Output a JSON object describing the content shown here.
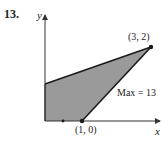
{
  "problem_number": "13.",
  "axes": {
    "x_label": "x",
    "y_label": "y"
  },
  "vertices": [
    {
      "label": "(3, 2)",
      "x": 3,
      "y": 2
    },
    {
      "label": "(1, 0)",
      "x": 1,
      "y": 0
    }
  ],
  "annotation": "Max = 13",
  "colors": {
    "region_fill": "#9a9a9a",
    "edge": "#1a1a1a",
    "axis": "#333333"
  }
}
